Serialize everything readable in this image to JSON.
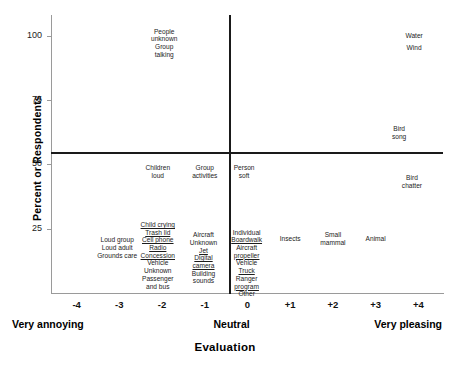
{
  "chart_data": {
    "type": "scatter",
    "title": "",
    "xlabel": "Evaluation",
    "ylabel": "Percent or Respondents",
    "xlim": [
      -4.6,
      4.6
    ],
    "ylim": [
      0,
      108
    ],
    "xticks": [
      "-4",
      "-3",
      "-2",
      "-1",
      "0",
      "+1",
      "+2",
      "+3",
      "+4"
    ],
    "xtick_values": [
      -4,
      -3,
      -2,
      -1,
      0,
      1,
      2,
      3,
      4
    ],
    "yticks": [
      "25",
      "50",
      "75",
      "100"
    ],
    "ytick_values": [
      25,
      50,
      75,
      100
    ],
    "grid": false,
    "legend": null,
    "anchors": [
      {
        "label": "Very annoying",
        "x": -4
      },
      {
        "label": "Neutral",
        "x": 0
      },
      {
        "label": "Very pleasing",
        "x": 4
      }
    ],
    "reference_lines": [
      {
        "orientation": "horizontal",
        "value": 51
      },
      {
        "orientation": "vertical",
        "value": 0
      }
    ],
    "points": [
      {
        "label": "People unknown",
        "x": -1.95,
        "y": 100,
        "underline": false
      },
      {
        "label": "Group talking",
        "x": -1.95,
        "y": 94,
        "underline": false
      },
      {
        "label": "Water",
        "x": 3.9,
        "y": 100,
        "underline": false
      },
      {
        "label": "Wind",
        "x": 3.9,
        "y": 95,
        "underline": false
      },
      {
        "label": "Bird song",
        "x": 3.55,
        "y": 62,
        "underline": false
      },
      {
        "label": "Bird chatter",
        "x": 3.85,
        "y": 43,
        "underline": false
      },
      {
        "label": "Children loud",
        "x": -2.1,
        "y": 47,
        "underline": false
      },
      {
        "label": "Group activities",
        "x": -1.0,
        "y": 47,
        "underline": false
      },
      {
        "label": "Person soft",
        "x": -0.08,
        "y": 47,
        "underline": false
      },
      {
        "label": "Insects",
        "x": 1.0,
        "y": 21,
        "underline": false
      },
      {
        "label": "Small mammal",
        "x": 2.0,
        "y": 21,
        "underline": false
      },
      {
        "label": "Animal",
        "x": 3.0,
        "y": 21,
        "underline": false
      }
    ],
    "stacks": [
      {
        "name": "column-minus3",
        "x": -3.05,
        "y_top": 22,
        "items": [
          {
            "label": "Loud group",
            "underline": false
          },
          {
            "label": "Loud adult",
            "underline": false
          },
          {
            "label": "Grounds care",
            "underline": false
          }
        ]
      },
      {
        "name": "column-minus2",
        "x": -2.1,
        "y_top": 28,
        "items": [
          {
            "label": "Child crying",
            "underline": true
          },
          {
            "label": "Trash lid",
            "underline": true
          },
          {
            "label": "Cell phone",
            "underline": true
          },
          {
            "label": "Radio",
            "underline": true
          },
          {
            "label": "Concession",
            "underline": true
          },
          {
            "label": "Vehicle",
            "underline": false
          },
          {
            "label": "Unknown",
            "underline": false
          },
          {
            "label": "Passenger",
            "underline": false
          },
          {
            "label": "and bus",
            "underline": false
          }
        ]
      },
      {
        "name": "column-minus1",
        "x": -1.03,
        "y_top": 24,
        "items": [
          {
            "label": "Aircraft",
            "underline": false
          },
          {
            "label": "Unknown",
            "underline": false
          },
          {
            "label": "Jet",
            "underline": true
          },
          {
            "label": "Digital",
            "underline": true
          },
          {
            "label": "camera",
            "underline": true
          },
          {
            "label": "Building",
            "underline": false
          },
          {
            "label": "sounds",
            "underline": false
          }
        ]
      },
      {
        "name": "column-zero",
        "x": -0.02,
        "y_top": 25,
        "items": [
          {
            "label": "Individual",
            "underline": false
          },
          {
            "label": "Boardwalk",
            "underline": true
          },
          {
            "label": "Aircraft",
            "underline": false
          },
          {
            "label": "propeller",
            "underline": true
          },
          {
            "label": "Vehicle",
            "underline": false
          },
          {
            "label": "Truck",
            "underline": true
          },
          {
            "label": "Ranger",
            "underline": false
          },
          {
            "label": "program",
            "underline": true
          },
          {
            "label": "Other",
            "underline": false
          }
        ]
      }
    ]
  }
}
